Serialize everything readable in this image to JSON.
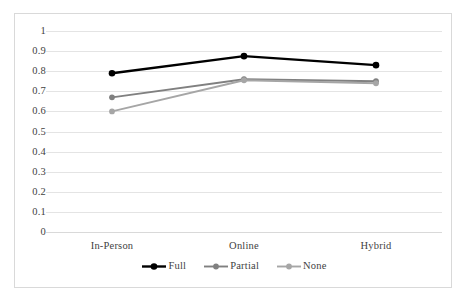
{
  "chart_data": {
    "type": "line",
    "title": "",
    "xlabel": "",
    "ylabel": "",
    "categories": [
      "In-Person",
      "Online",
      "Hybrid"
    ],
    "series": [
      {
        "name": "Full",
        "values": [
          0.79,
          0.875,
          0.83
        ],
        "color": "#000000"
      },
      {
        "name": "Partial",
        "values": [
          0.67,
          0.76,
          0.75
        ],
        "color": "#808080"
      },
      {
        "name": "None",
        "values": [
          0.6,
          0.755,
          0.74
        ],
        "color": "#a6a6a6"
      }
    ],
    "ylim": [
      0,
      1
    ],
    "ytick_step": 0.1,
    "ytick_labels": [
      "1",
      "0.9",
      "0.8",
      "0.7",
      "0.6",
      "0.5",
      "0.4",
      "0.3",
      "0.2",
      "0.1",
      "0"
    ],
    "grid": true,
    "legend_position": "bottom",
    "markers": "circle"
  },
  "legend": {
    "items": [
      {
        "label": "Full"
      },
      {
        "label": "Partial"
      },
      {
        "label": "None"
      }
    ]
  }
}
